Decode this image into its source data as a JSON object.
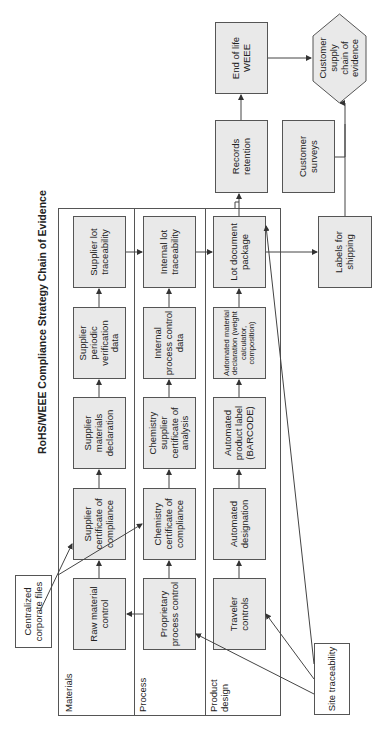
{
  "title": "RoHS/WEEE Compliance Strategy Chain of Evidence",
  "lanes": [
    {
      "label": "Materials"
    },
    {
      "label": "Process"
    },
    {
      "label": "Product design"
    }
  ],
  "materials": [
    "Raw material control",
    "Supplier certificate of compliance",
    "Supplier materials declaration",
    "Supplier periodic verification data",
    "Supplier lot traceability"
  ],
  "process": [
    "Proprietary process control",
    "Chemistry certificate of compliance",
    "Chemistry supplier certificate of analysis",
    "Internal process control data",
    "Internal lot traceability"
  ],
  "design": [
    "Traveler controls",
    "Automated designation",
    "Automated product label (BARCODE)",
    "Automated material declaration (weight calculator, composition)",
    "Lot document package"
  ],
  "external": {
    "centralized": "Centralized corporate files",
    "site": "Site traceability",
    "records": "Records retention",
    "end_of_life": "End of life WEEE",
    "labels": "Labels for shipping",
    "surveys": "Customer surveys",
    "customer_chain": "Customer supply chain of evidence"
  },
  "colors": {
    "box_fill": "#e9e9e9",
    "line": "#555555",
    "hex_fill": "#e9e9e9"
  }
}
